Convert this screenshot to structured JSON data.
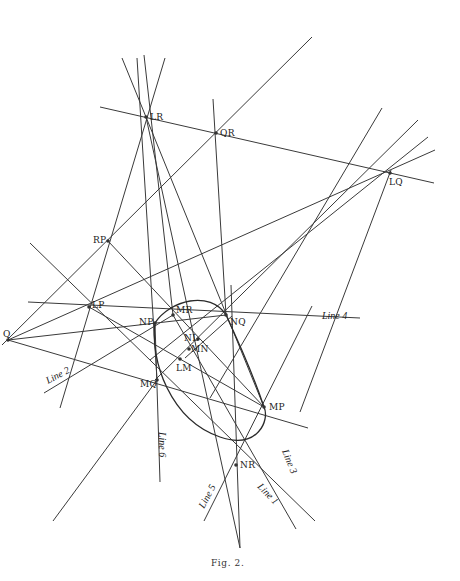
{
  "figure": {
    "caption": "Fig. 2.",
    "caption_pos": [
      211,
      566
    ],
    "colors": {
      "line": "#3a3a3a",
      "text": "#222222",
      "background": "#ffffff"
    }
  },
  "points": [
    {
      "id": "LR",
      "label": "LR",
      "x": 146,
      "y": 117,
      "lx": 150,
      "ly": 120
    },
    {
      "id": "QR",
      "label": "QR",
      "x": 216,
      "y": 133,
      "lx": 220,
      "ly": 136
    },
    {
      "id": "LQ",
      "label": "LQ",
      "x": 390,
      "y": 173,
      "lx": 389,
      "ly": 185
    },
    {
      "id": "RP",
      "label": "RP",
      "x": 108,
      "y": 241,
      "lx": 93,
      "ly": 243
    },
    {
      "id": "LP",
      "label": "LP",
      "x": 89,
      "y": 307,
      "lx": 92,
      "ly": 308
    },
    {
      "id": "MR",
      "label": "MR",
      "x": 173,
      "y": 315,
      "lx": 176,
      "ly": 313
    },
    {
      "id": "NP",
      "label": "NP",
      "x": 155,
      "y": 323,
      "lx": 139,
      "ly": 325
    },
    {
      "id": "NQ",
      "label": "NQ",
      "x": 226,
      "y": 315,
      "lx": 230,
      "ly": 325
    },
    {
      "id": "Q",
      "label": "Q",
      "x": 8,
      "y": 340,
      "lx": 3,
      "ly": 337
    },
    {
      "id": "NL",
      "label": "NL",
      "x": 198,
      "y": 339,
      "lx": 184,
      "ly": 341
    },
    {
      "id": "MN",
      "label": "MN",
      "x": 189,
      "y": 349,
      "lx": 191,
      "ly": 352
    },
    {
      "id": "LM",
      "label": "LM",
      "x": 180,
      "y": 359,
      "lx": 176,
      "ly": 371
    },
    {
      "id": "MQ",
      "label": "MQ",
      "x": 157,
      "y": 380,
      "lx": 140,
      "ly": 387
    },
    {
      "id": "MP",
      "label": "MP",
      "x": 264,
      "y": 407,
      "lx": 269,
      "ly": 410
    },
    {
      "id": "NR",
      "label": "NR",
      "x": 236,
      "y": 465,
      "lx": 240,
      "ly": 468
    }
  ],
  "lines": [
    {
      "id": "LR-QR-LQ",
      "x1": 100,
      "y1": 107,
      "x2": 434,
      "y2": 183
    },
    {
      "id": "Q-diag-up",
      "x1": 2,
      "y1": 345,
      "x2": 312,
      "y2": 37
    },
    {
      "id": "LQ-diag-up",
      "x1": 210,
      "y1": 398,
      "x2": 382,
      "y2": 108
    },
    {
      "id": "LQ-ray-1",
      "x1": 155,
      "y1": 380,
      "x2": 418,
      "y2": 120
    },
    {
      "id": "LQ-ray-2",
      "x1": 8,
      "y1": 340,
      "x2": 435,
      "y2": 150
    },
    {
      "id": "LQ-ray-3",
      "x1": 150,
      "y1": 360,
      "x2": 428,
      "y2": 137
    },
    {
      "id": "LQ-down",
      "x1": 391,
      "y1": 170,
      "x2": 300,
      "y2": 412
    },
    {
      "id": "QR-vertical",
      "x1": 213,
      "y1": 99,
      "x2": 226,
      "y2": 315
    },
    {
      "id": "LR-ray-a",
      "x1": 122,
      "y1": 58,
      "x2": 264,
      "y2": 407
    },
    {
      "id": "LR-ray-b",
      "x1": 137,
      "y1": 58,
      "x2": 157,
      "y2": 380
    },
    {
      "id": "LR-ray-c",
      "x1": 144,
      "y1": 55,
      "x2": 173,
      "y2": 315
    },
    {
      "id": "LR-ray-d",
      "x1": 165,
      "y1": 58,
      "x2": 60,
      "y2": 408
    },
    {
      "id": "LR-ray-e",
      "x1": 146,
      "y1": 117,
      "x2": 240,
      "y2": 548
    },
    {
      "id": "RP-ray",
      "x1": 108,
      "y1": 241,
      "x2": 264,
      "y2": 407
    },
    {
      "id": "line4",
      "x1": 28,
      "y1": 302,
      "x2": 360,
      "y2": 318
    },
    {
      "id": "LP-MP",
      "x1": 30,
      "y1": 243,
      "x2": 315,
      "y2": 521
    },
    {
      "id": "LP-ray",
      "x1": 89,
      "y1": 307,
      "x2": 264,
      "y2": 407
    },
    {
      "id": "Q-MP",
      "x1": 8,
      "y1": 340,
      "x2": 308,
      "y2": 428
    },
    {
      "id": "Q-NQ",
      "x1": 8,
      "y1": 340,
      "x2": 226,
      "y2": 315
    },
    {
      "id": "line2",
      "x1": 44,
      "y1": 393,
      "x2": 173,
      "y2": 315
    },
    {
      "id": "line6",
      "x1": 155,
      "y1": 323,
      "x2": 160,
      "y2": 482
    },
    {
      "id": "MQ-down",
      "x1": 157,
      "y1": 380,
      "x2": 53,
      "y2": 521
    },
    {
      "id": "MR-line1",
      "x1": 173,
      "y1": 315,
      "x2": 296,
      "y2": 529
    },
    {
      "id": "NR-line5",
      "x1": 204,
      "y1": 521,
      "x2": 312,
      "y2": 306
    },
    {
      "id": "NR-vertical",
      "x1": 231,
      "y1": 285,
      "x2": 240,
      "y2": 548
    },
    {
      "id": "MR-MN-diag",
      "x1": 185,
      "y1": 358,
      "x2": 232,
      "y2": 316
    }
  ],
  "line_labels": [
    {
      "text": "Line",
      "num": "4",
      "x": 322,
      "y": 319,
      "rot": 0
    },
    {
      "text": "Line",
      "num": "2",
      "x": 48,
      "y": 384,
      "rot": -28
    },
    {
      "text": "Line",
      "num": "6",
      "x": 159,
      "y": 432,
      "rot": 90
    },
    {
      "text": "Line",
      "num": "3",
      "x": 282,
      "y": 451,
      "rot": 68
    },
    {
      "text": "Line",
      "num": "5",
      "x": 204,
      "y": 509,
      "rot": -62
    },
    {
      "text": "Line",
      "num": "1",
      "x": 257,
      "y": 487,
      "rot": 46
    }
  ],
  "ellipse": {
    "path": "M 155 323 C 150 360, 170 420, 220 437 C 258 450, 270 420, 264 407 C 255 380, 240 345, 226 315 C 210 290, 170 300, 155 323 Z"
  }
}
